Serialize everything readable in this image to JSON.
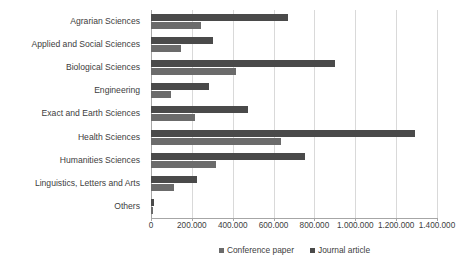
{
  "chart_data": {
    "type": "bar",
    "orientation": "horizontal",
    "title": "",
    "subtitle": "",
    "xlabel": "",
    "ylabel": "",
    "xlim": [
      0,
      1400000
    ],
    "xtick_step": 200000,
    "grid": true,
    "legend_position": "bottom",
    "tick_labels": [
      "0",
      "200.000",
      "400.000",
      "600.000",
      "800.000",
      "1.000.000",
      "1.200.000",
      "1.400.000"
    ],
    "tick_values": [
      0,
      200000,
      400000,
      600000,
      800000,
      1000000,
      1200000,
      1400000
    ],
    "categories": [
      "Agrarian Sciences",
      "Applied and Social Sciences",
      "Biological Sciences",
      "Engineering",
      "Exact and Earth Sciences",
      "Health Sciences",
      "Humanities Sciences",
      "Linguistics, Letters and Arts",
      "Others"
    ],
    "series": [
      {
        "name": "Conference paper",
        "color": "#6b6b6b",
        "values": [
          245000,
          148000,
          417000,
          96000,
          215000,
          637000,
          319000,
          115000,
          10000
        ]
      },
      {
        "name": "Journal article",
        "color": "#4a4a4a",
        "values": [
          672000,
          305000,
          902000,
          284000,
          475000,
          1294000,
          755000,
          226000,
          15000
        ]
      }
    ]
  },
  "legend": {
    "items": [
      {
        "label": "Conference paper"
      },
      {
        "label": "Journal article"
      }
    ]
  }
}
